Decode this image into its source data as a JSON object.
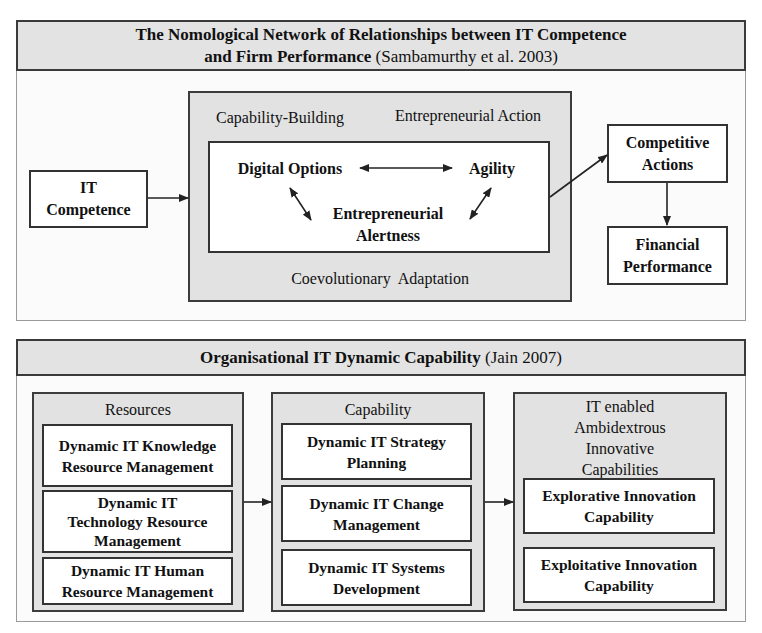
{
  "top": {
    "header": {
      "title_bold_line1": "The Nomological Network of Relationships between IT Competence",
      "title_bold_line2": "and Firm Performance",
      "citation": "(Sambamurthy et al. 2003)"
    },
    "it_competence": {
      "line1": "IT",
      "line2": "Competence"
    },
    "middle": {
      "label_top_left": "Capability-Building",
      "label_top_right": "Entrepreneurial Action",
      "label_bottom": "Coevolutionary  Adaptation",
      "nodes": {
        "digital_options": "Digital Options",
        "agility": "Agility",
        "alertness_line1": "Entrepreneurial",
        "alertness_line2": "Alertness"
      }
    },
    "competitive_actions": {
      "line1": "Competitive",
      "line2": "Actions"
    },
    "financial_performance": {
      "line1": "Financial",
      "line2": "Performance"
    }
  },
  "bottom": {
    "header": {
      "title_bold": "Organisational IT Dynamic Capability",
      "citation": "(Jain 2007)"
    },
    "columns": [
      {
        "title": "Resources",
        "items": [
          {
            "line1": "Dynamic IT Knowledge",
            "line2": "Resource Management",
            "line3": ""
          },
          {
            "line1": "Dynamic IT",
            "line2": "Technology Resource",
            "line3": "Management"
          },
          {
            "line1": "Dynamic IT Human",
            "line2": "Resource Management",
            "line3": ""
          }
        ]
      },
      {
        "title": "Capability",
        "items": [
          {
            "line1": "Dynamic IT Strategy",
            "line2": "Planning"
          },
          {
            "line1": "Dynamic IT Change",
            "line2": "Management"
          },
          {
            "line1": "Dynamic IT Systems",
            "line2": "Development"
          }
        ]
      },
      {
        "title_line1": "IT enabled",
        "title_line2": "Ambidextrous",
        "title_line3": "Innovative",
        "title_line4": "Capabilities",
        "items": [
          {
            "line1": "Explorative Innovation",
            "line2": "Capability"
          },
          {
            "line1": "Exploitative Innovation",
            "line2": "Capability"
          }
        ]
      }
    ]
  },
  "colors": {
    "header_fill": "#e3e3e3",
    "group_fill": "#e2e2e2",
    "border": "#333333"
  }
}
